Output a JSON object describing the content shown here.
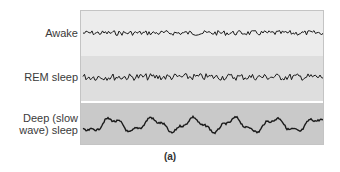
{
  "figure": {
    "caption": "(a)",
    "traces": [
      {
        "label": "Awake",
        "type": "low-amplitude high-frequency"
      },
      {
        "label": "REM sleep",
        "type": "low-amplitude high-frequency irregular"
      },
      {
        "label_line1": "Deep (slow",
        "label_line2": "wave) sleep",
        "type": "high-amplitude low-frequency"
      }
    ],
    "colors": {
      "awake_band": "#ececec",
      "rem_band": "#dedede",
      "deep_band": "#c9c9c9",
      "trace": "#1a1a1a"
    }
  }
}
